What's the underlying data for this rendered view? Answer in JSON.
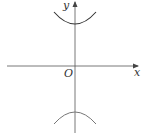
{
  "diagram": {
    "type": "coordinate-plot",
    "axes": {
      "x_label": "x",
      "y_label": "y",
      "origin_label": "O"
    },
    "curves": [
      {
        "name": "upper-branch",
        "opens": "up",
        "vertex_y_relative": "positive"
      },
      {
        "name": "lower-branch",
        "opens": "down",
        "vertex_y_relative": "negative"
      }
    ],
    "colors": {
      "axis": "#555555",
      "upper_curve": "#333333",
      "lower_curve": "#777777",
      "background": "#ffffff"
    }
  }
}
